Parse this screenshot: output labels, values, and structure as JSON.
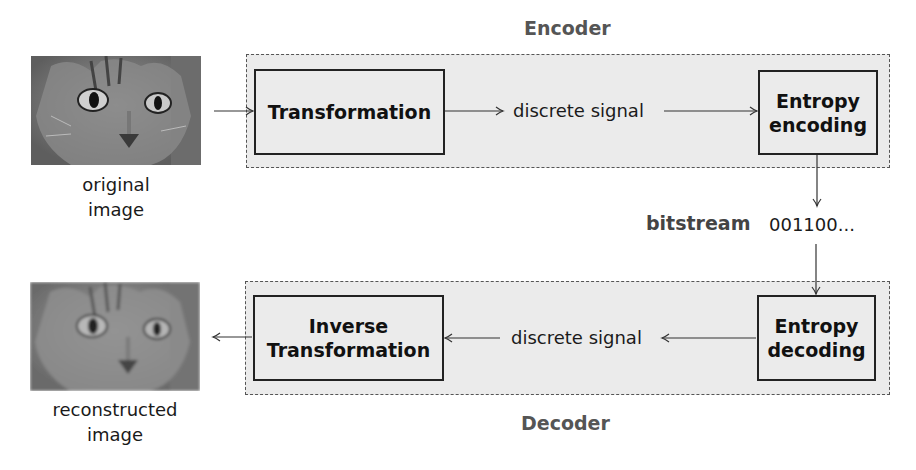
{
  "encoder": {
    "label": "Encoder",
    "transform_label": "Transformation",
    "signal_label": "discrete signal",
    "entropy_line1": "Entropy",
    "entropy_line2": "encoding"
  },
  "bitstream": {
    "label": "bitstream",
    "value": "001100..."
  },
  "decoder": {
    "label": "Decoder",
    "transform_line1": "Inverse",
    "transform_line2": "Transformation",
    "signal_label": "discrete signal",
    "entropy_line1": "Entropy",
    "entropy_line2": "decoding"
  },
  "images": {
    "original_line1": "original",
    "original_line2": "image",
    "reconstructed_line1": "reconstructed",
    "reconstructed_line2": "image"
  },
  "colors": {
    "group_fill": "#ebebeb",
    "group_label": "#555555",
    "block_border": "#222222"
  }
}
